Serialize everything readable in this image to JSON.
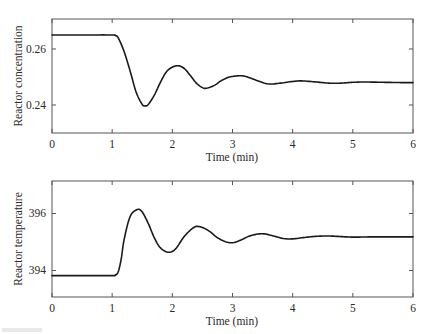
{
  "chart_data": [
    {
      "type": "line",
      "title": "",
      "xlabel": "Time (min)",
      "ylabel": "Reactor concentration",
      "xlim": [
        0,
        6
      ],
      "ylim": [
        0.23,
        0.2707
      ],
      "xticks": [
        0,
        1,
        2,
        3,
        4,
        5,
        6
      ],
      "xtick_labels": [
        "0",
        "1",
        "2",
        "3",
        "4",
        "5",
        "6"
      ],
      "yticks": [
        0.24,
        0.26
      ],
      "ytick_labels": [
        "0.24",
        "0.26"
      ],
      "grid": false,
      "legend": null,
      "series": [
        {
          "name": "Reactor concentration",
          "x": [
            0,
            0.5,
            1.0,
            1.05,
            1.1,
            1.2,
            1.3,
            1.4,
            1.5,
            1.55,
            1.6,
            1.7,
            1.8,
            1.9,
            2.0,
            2.1,
            2.2,
            2.3,
            2.4,
            2.5,
            2.57,
            2.7,
            2.8,
            2.9,
            3.0,
            3.17,
            3.3,
            3.45,
            3.6,
            3.8,
            4.0,
            4.15,
            4.4,
            4.6,
            4.8,
            5.0,
            5.2,
            5.5,
            5.8,
            6.0
          ],
          "values": [
            0.265,
            0.265,
            0.265,
            0.2648,
            0.264,
            0.259,
            0.252,
            0.2445,
            0.2402,
            0.2397,
            0.2402,
            0.2435,
            0.248,
            0.2518,
            0.2535,
            0.254,
            0.253,
            0.2505,
            0.2478,
            0.2462,
            0.246,
            0.247,
            0.2485,
            0.2496,
            0.2502,
            0.2504,
            0.2496,
            0.2484,
            0.2475,
            0.2478,
            0.2484,
            0.2486,
            0.2482,
            0.2478,
            0.2478,
            0.2481,
            0.2482,
            0.2481,
            0.248,
            0.248
          ]
        }
      ]
    },
    {
      "type": "line",
      "title": "",
      "xlabel": "Time (min)",
      "ylabel": "Reactor temperature",
      "xlim": [
        0,
        6
      ],
      "ylim": [
        393.07,
        397.14
      ],
      "xticks": [
        0,
        1,
        2,
        3,
        4,
        5,
        6
      ],
      "xtick_labels": [
        "0",
        "1",
        "2",
        "3",
        "4",
        "5",
        "6"
      ],
      "yticks": [
        394,
        396
      ],
      "ytick_labels": [
        "394",
        "396"
      ],
      "grid": false,
      "legend": null,
      "series": [
        {
          "name": "Reactor temperature",
          "x": [
            0,
            0.5,
            1.0,
            1.05,
            1.1,
            1.15,
            1.2,
            1.3,
            1.42,
            1.5,
            1.6,
            1.7,
            1.8,
            1.93,
            2.05,
            2.2,
            2.35,
            2.45,
            2.6,
            2.75,
            2.9,
            3.02,
            3.15,
            3.3,
            3.5,
            3.7,
            3.85,
            4.0,
            4.2,
            4.4,
            4.6,
            4.8,
            5.0,
            5.3,
            5.6,
            6.0
          ],
          "values": [
            393.82,
            393.82,
            393.82,
            393.84,
            393.95,
            394.4,
            395.1,
            395.9,
            396.14,
            396.05,
            395.65,
            395.15,
            394.8,
            394.64,
            394.75,
            395.2,
            395.5,
            395.54,
            395.4,
            395.15,
            395.0,
            394.98,
            395.08,
            395.22,
            395.29,
            395.2,
            395.12,
            395.11,
            395.16,
            395.2,
            395.21,
            395.19,
            395.17,
            395.18,
            395.18,
            395.18
          ]
        }
      ]
    }
  ],
  "panels": [
    {
      "ylabel": "Reactor concentration",
      "xlabel": "Time (min)"
    },
    {
      "ylabel": "Reactor temperature",
      "xlabel": "Time (min)"
    }
  ]
}
